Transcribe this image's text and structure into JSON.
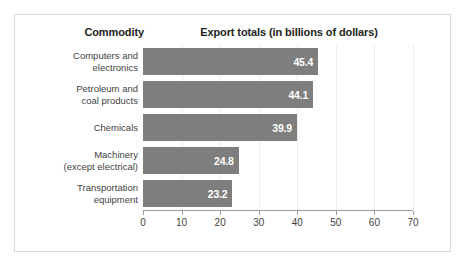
{
  "chart": {
    "type": "bar",
    "orientation": "horizontal",
    "header_commodity": "Commodity",
    "header_export": "Export totals (in billions of dollars)",
    "bar_color": "#7e7e7e",
    "value_label_color": "#ffffff",
    "axis_color": "#9b9b9b",
    "gridline_color": "#ededed",
    "frame_color": "#d9d9d9",
    "background": "#ffffff"
  },
  "chart_data": {
    "type": "bar",
    "title": "Export totals (in billions of dollars)",
    "xlabel": "",
    "ylabel": "Commodity",
    "categories": [
      "Computers and electronics",
      "Petroleum and coal products",
      "Chemicals",
      "Machinery (except electrical)",
      "Transportation equipment"
    ],
    "category_lines": [
      [
        "Computers and",
        "electronics"
      ],
      [
        "Petroleum and",
        "coal products"
      ],
      [
        "Chemicals",
        ""
      ],
      [
        "Machinery",
        "(except electrical)"
      ],
      [
        "Transportation",
        "equipment"
      ]
    ],
    "values": [
      45.4,
      44.1,
      39.9,
      24.8,
      23.2
    ],
    "value_labels": [
      "45.4",
      "44.1",
      "39.9",
      "24.8",
      "23.2"
    ],
    "xlim": [
      0,
      70
    ],
    "xticks": [
      0,
      10,
      20,
      30,
      40,
      50,
      60,
      70
    ],
    "xtick_labels": [
      "0",
      "10",
      "20",
      "30",
      "40",
      "50",
      "60",
      "70"
    ],
    "grid": true,
    "legend": false,
    "units": "billions of dollars"
  }
}
